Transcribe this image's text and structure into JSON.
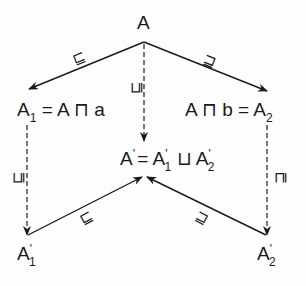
{
  "diagram": {
    "nodes": {
      "top": {
        "base": "A"
      },
      "left": {
        "base": "A",
        "sub": "1",
        "rest": "= A ⊓ a"
      },
      "right": {
        "prefix": "A ⊓ b =",
        "base": "A",
        "sub": "2"
      },
      "center": {
        "base": "A",
        "prime": "'",
        "eq": "=",
        "t1_base": "A",
        "t1_prime": "'",
        "t1_sub": "1",
        "op": "⊔",
        "t2_base": "A",
        "t2_prime": "'",
        "t2_sub": "2"
      },
      "bottom_left": {
        "base": "A",
        "prime": "'",
        "sub": "1"
      },
      "bottom_right": {
        "base": "A",
        "prime": "'",
        "sub": "2"
      }
    },
    "edges": [
      {
        "from": "A",
        "to": "A1",
        "style": "solid",
        "label": "⊑"
      },
      {
        "from": "A",
        "to": "A2",
        "style": "solid",
        "label": "⊒"
      },
      {
        "from": "A",
        "to": "A'",
        "style": "dashed",
        "label": "⊑"
      },
      {
        "from": "A1",
        "to": "A'1",
        "style": "dashed",
        "label": "⊑"
      },
      {
        "from": "A2",
        "to": "A'2",
        "style": "dashed",
        "label": "⊒"
      },
      {
        "from": "A'1",
        "to": "A'",
        "style": "solid",
        "label": "⊑"
      },
      {
        "from": "A'2",
        "to": "A'",
        "style": "solid",
        "label": "⊒"
      }
    ],
    "colors": {
      "ink": "#1a1a1a",
      "background": "#fdfdfd"
    }
  }
}
